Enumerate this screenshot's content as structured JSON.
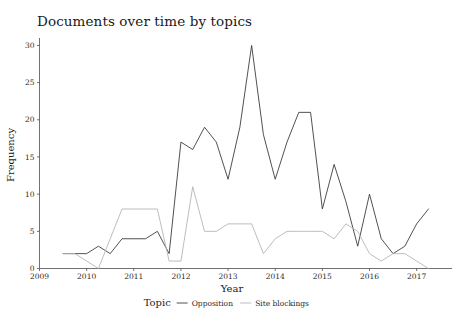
{
  "chart_data": {
    "type": "line",
    "title": "Documents over time by topics",
    "xlabel": "Year",
    "ylabel": "Frequency",
    "legend_title": "Topic",
    "legend_position": "bottom",
    "grid": false,
    "xlim": [
      2009,
      2017.75
    ],
    "ylim": [
      0,
      31
    ],
    "xticks": [
      2009,
      2010,
      2011,
      2012,
      2013,
      2014,
      2015,
      2016,
      2017
    ],
    "xtick_labels": [
      "2009",
      "2010",
      "2011",
      "2012",
      "2013",
      "2014",
      "2015",
      "2016",
      "2017"
    ],
    "yticks": [
      0,
      5,
      10,
      15,
      20,
      25,
      30
    ],
    "ytick_labels": [
      "0",
      "5",
      "10",
      "15",
      "20",
      "25",
      "30"
    ],
    "x": [
      2009.5,
      2009.75,
      2010.0,
      2010.25,
      2010.5,
      2010.75,
      2011.0,
      2011.25,
      2011.5,
      2011.75,
      2012.0,
      2012.25,
      2012.5,
      2012.75,
      2013.0,
      2013.25,
      2013.5,
      2013.75,
      2014.0,
      2014.25,
      2014.5,
      2014.75,
      2015.0,
      2015.25,
      2015.5,
      2015.75,
      2016.0,
      2016.25,
      2016.5,
      2016.75,
      2017.0,
      2017.25
    ],
    "series": [
      {
        "name": "Opposition",
        "color": "#3d3d3d",
        "values": [
          2,
          2,
          2,
          3,
          2,
          4,
          4,
          4,
          5,
          2,
          17,
          16,
          19,
          17,
          12,
          19,
          30,
          18,
          12,
          17,
          21,
          21,
          8,
          14,
          9,
          3,
          10,
          4,
          2,
          3,
          6,
          8
        ]
      },
      {
        "name": "Site blockings",
        "color": "#b5b5b5",
        "values": [
          2,
          2,
          1,
          0,
          4,
          8,
          8,
          8,
          8,
          1,
          1,
          11,
          5,
          5,
          6,
          6,
          6,
          2,
          4,
          5,
          5,
          5,
          5,
          4,
          6,
          5,
          2,
          1,
          2,
          2,
          1,
          0
        ]
      }
    ]
  }
}
